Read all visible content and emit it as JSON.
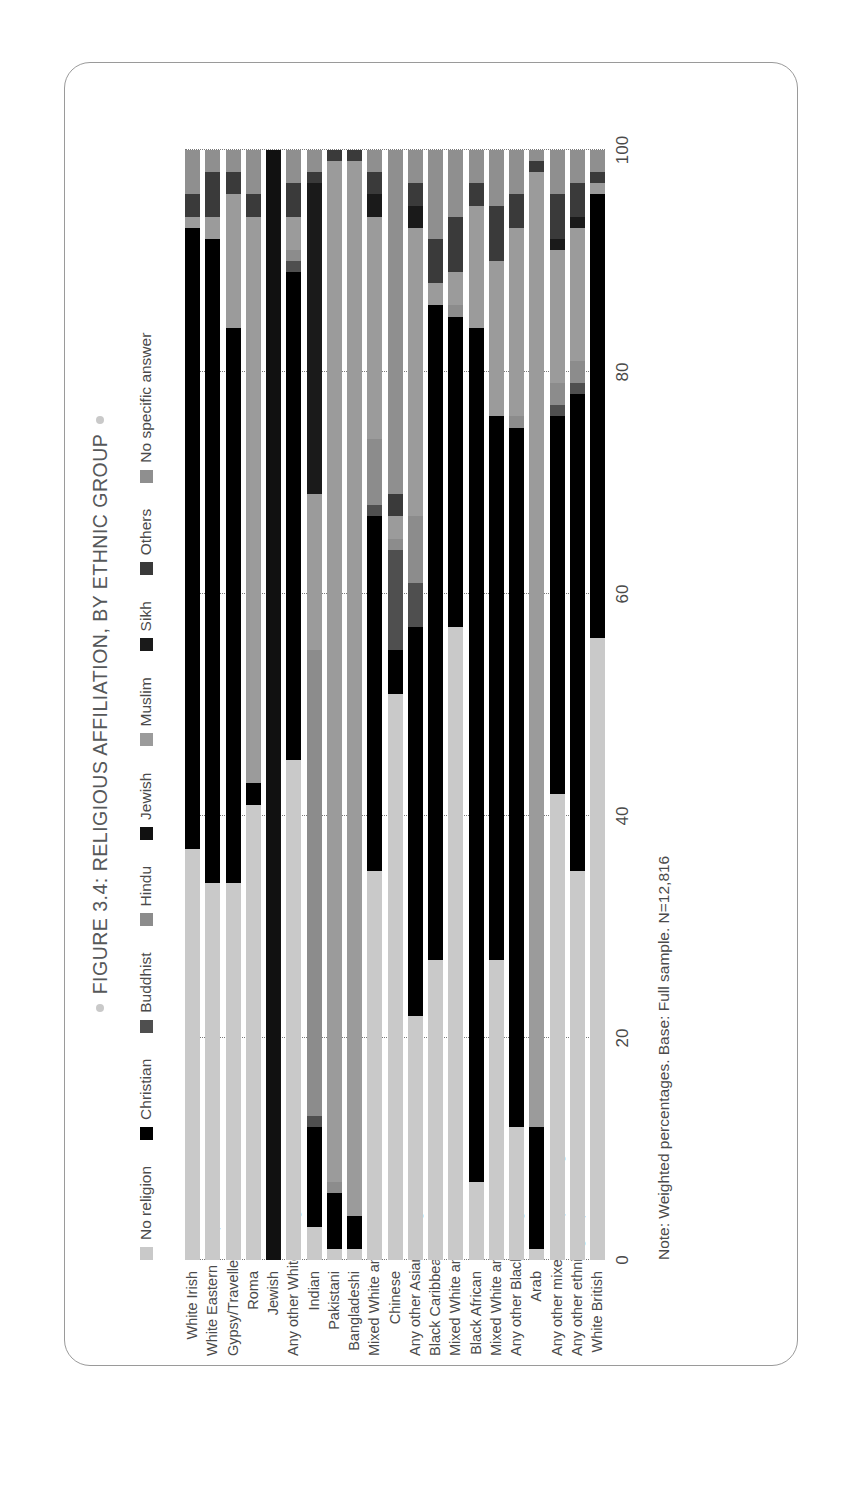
{
  "figure": {
    "title": "FIGURE 3.4: RELIGIOUS AFFILIATION, BY ETHNIC GROUP",
    "note": "Note: Weighted percentages. Base: Full sample. N=12,816"
  },
  "chart_data": {
    "type": "bar",
    "orientation": "horizontal",
    "stacked": true,
    "title": "FIGURE 3.4: RELIGIOUS AFFILIATION, BY ETHNIC GROUP",
    "xlabel": "",
    "ylabel": "",
    "xlim": [
      0,
      100
    ],
    "xticks": [
      0,
      20,
      40,
      60,
      80,
      100
    ],
    "grid": true,
    "legend_position": "top",
    "colors": {
      "No religion": "#c9c9c9",
      "Christian": "#000000",
      "Buddhist": "#4f4f4f",
      "Hindu": "#8c8c8c",
      "Jewish": "#111111",
      "Muslim": "#9b9b9b",
      "Sikh": "#1a1a1a",
      "Others": "#3a3a3a",
      "No specific answer": "#8f8f8f"
    },
    "categories": [
      "White Irish",
      "White Eastern European",
      "Gypsy/Traveller",
      "Roma",
      "Jewish",
      "Any other White background",
      "Indian",
      "Pakistani",
      "Bangladeshi",
      "Mixed White and Asian",
      "Chinese",
      "Any other Asian background",
      "Black Caribbean",
      "Mixed White and Black Caribbean",
      "Black African",
      "Mixed White and Black African",
      "Any other Black background",
      "Arab",
      "Any other mixed/multiple background",
      "Any other ethnic group",
      "White British"
    ],
    "series": [
      {
        "name": "No religion",
        "values": [
          37,
          34,
          34,
          41,
          0,
          45,
          3,
          1,
          1,
          35,
          51,
          22,
          27,
          57,
          7,
          27,
          12,
          1,
          42,
          35,
          56
        ]
      },
      {
        "name": "Christian",
        "values": [
          56,
          58,
          50,
          2,
          0,
          44,
          9,
          5,
          3,
          32,
          4,
          35,
          59,
          28,
          77,
          49,
          63,
          11,
          34,
          43,
          40
        ]
      },
      {
        "name": "Buddhist",
        "values": [
          0,
          0,
          0,
          0,
          0,
          1,
          1,
          0,
          0,
          1,
          9,
          4,
          0,
          0,
          0,
          0,
          0,
          0,
          1,
          1,
          0
        ]
      },
      {
        "name": "Hindu",
        "values": [
          0,
          0,
          0,
          0,
          0,
          1,
          42,
          1,
          0,
          6,
          1,
          6,
          0,
          1,
          0,
          0,
          1,
          0,
          2,
          2,
          0
        ]
      },
      {
        "name": "Jewish",
        "values": [
          0,
          0,
          0,
          0,
          100,
          0,
          0,
          0,
          0,
          0,
          0,
          0,
          0,
          0,
          0,
          0,
          0,
          0,
          0,
          0,
          0
        ]
      },
      {
        "name": "Muslim",
        "values": [
          1,
          2,
          12,
          51,
          0,
          3,
          14,
          92,
          95,
          20,
          2,
          26,
          2,
          3,
          11,
          14,
          17,
          86,
          12,
          12,
          1
        ]
      },
      {
        "name": "Sikh",
        "values": [
          0,
          0,
          0,
          0,
          0,
          0,
          28,
          0,
          0,
          2,
          0,
          2,
          0,
          0,
          0,
          0,
          0,
          0,
          1,
          1,
          0
        ]
      },
      {
        "name": "Others",
        "values": [
          2,
          4,
          2,
          2,
          0,
          3,
          1,
          1,
          1,
          2,
          2,
          2,
          4,
          5,
          2,
          5,
          3,
          1,
          4,
          3,
          1
        ]
      },
      {
        "name": "No specific answer",
        "values": [
          4,
          2,
          2,
          4,
          0,
          3,
          2,
          0,
          0,
          2,
          31,
          3,
          8,
          6,
          3,
          5,
          4,
          1,
          4,
          3,
          2
        ]
      }
    ]
  },
  "legend": {
    "items": [
      {
        "label": "No religion",
        "color": "#c9c9c9"
      },
      {
        "label": "Christian",
        "color": "#000000"
      },
      {
        "label": "Buddhist",
        "color": "#4f4f4f"
      },
      {
        "label": "Hindu",
        "color": "#8c8c8c"
      },
      {
        "label": "Jewish",
        "color": "#111111"
      },
      {
        "label": "Muslim",
        "color": "#9b9b9b"
      },
      {
        "label": "Sikh",
        "color": "#1a1a1a"
      },
      {
        "label": "Others",
        "color": "#3a3a3a"
      },
      {
        "label": "No specific answer",
        "color": "#8f8f8f"
      }
    ]
  }
}
